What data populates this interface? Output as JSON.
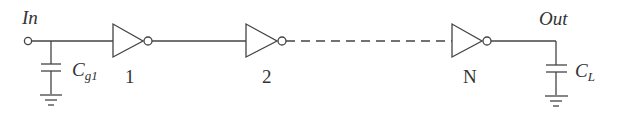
{
  "diagram": {
    "type": "inverter-chain",
    "input_label": "In",
    "output_label": "Out",
    "input_cap": {
      "symbol": "C",
      "subscript": "g1"
    },
    "load_cap": {
      "symbol": "C",
      "subscript": "L"
    },
    "stages": [
      {
        "label": "1"
      },
      {
        "label": "2"
      },
      {
        "label": "N"
      }
    ],
    "connector_between_2_and_N": "dashed",
    "stroke_color": "#444444"
  }
}
